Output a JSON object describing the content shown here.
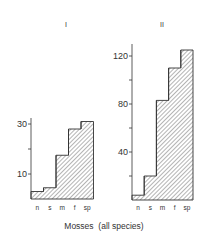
{
  "chart_data": [
    {
      "type": "bar",
      "title": "I",
      "categories": [
        "n",
        "s",
        "m",
        "f",
        "sp"
      ],
      "values": [
        3,
        4.5,
        17.5,
        28,
        31
      ],
      "yticks": [
        10,
        20,
        30
      ],
      "ytick_labels": [
        "10",
        "",
        "30"
      ],
      "ylim": [
        0,
        33
      ],
      "xlabel": "",
      "ylabel": "",
      "style": "stepped histogram, hatched fill",
      "grid": false
    },
    {
      "type": "bar",
      "title": "II",
      "categories": [
        "n",
        "s",
        "m",
        "f",
        "sp"
      ],
      "values": [
        4,
        20,
        83,
        110,
        125
      ],
      "yticks": [
        20,
        40,
        60,
        80,
        100,
        120
      ],
      "ytick_labels": [
        "",
        "40",
        "",
        "80",
        "",
        "120"
      ],
      "ylim": [
        0,
        130
      ],
      "xlabel": "",
      "ylabel": "",
      "style": "stepped histogram, hatched fill",
      "grid": false
    }
  ],
  "shared_xlabel": "Mosses  (all species)",
  "colors": {
    "stroke": "#333333",
    "hatch": "#444444",
    "background": "#ffffff"
  }
}
